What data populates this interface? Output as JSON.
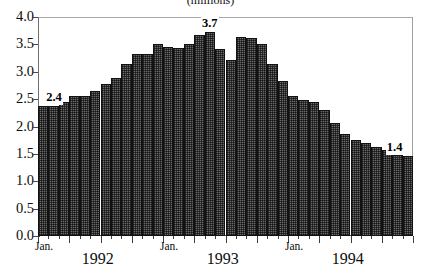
{
  "chart_data": {
    "type": "bar",
    "title": "(millions)",
    "xlabel": "",
    "ylabel": "",
    "ylim": [
      0.0,
      4.0
    ],
    "ytick_labels": [
      "4.0",
      "3.5",
      "3.0",
      "2.5",
      "2.0",
      "1.5",
      "1.0",
      "0.5",
      "0.0"
    ],
    "ytick_values": [
      4.0,
      3.5,
      3.0,
      2.5,
      2.0,
      1.5,
      1.0,
      0.5,
      0.0
    ],
    "grid": false,
    "legend": null,
    "legend_position": "none",
    "x_axis_groups": [
      {
        "month_label": "Jan.",
        "year_label": "1992",
        "start_index": 0
      },
      {
        "month_label": "Jan.",
        "year_label": "1993",
        "start_index": 12
      },
      {
        "month_label": "Jan.",
        "year_label": "1994",
        "start_index": 24
      }
    ],
    "categories": [
      "Jan. 1992",
      "Feb. 1992",
      "Mar. 1992",
      "Apr. 1992",
      "May 1992",
      "Jun. 1992",
      "Jul. 1992",
      "Aug. 1992",
      "Sep. 1992",
      "Oct. 1992",
      "Nov. 1992",
      "Dec. 1992",
      "Jan. 1993",
      "Feb. 1993",
      "Mar. 1993",
      "Apr. 1993",
      "May 1993",
      "Jun. 1993",
      "Jul. 1993",
      "Aug. 1993",
      "Sep. 1993",
      "Oct. 1993",
      "Nov. 1993",
      "Dec. 1993",
      "Jan. 1994",
      "Feb. 1994",
      "Mar. 1994",
      "Apr. 1994",
      "May 1994",
      "Jun. 1994",
      "Jul. 1994",
      "Aug. 1994",
      "Sep. 1994",
      "Oct. 1994",
      "Nov. 1994",
      "Dec. 1994"
    ],
    "values": [
      2.38,
      2.38,
      2.44,
      2.56,
      2.56,
      2.64,
      2.78,
      2.88,
      3.15,
      3.32,
      3.32,
      3.51,
      3.45,
      3.44,
      3.51,
      3.68,
      3.72,
      3.42,
      3.21,
      3.64,
      3.61,
      3.5,
      3.15,
      2.83,
      2.55,
      2.48,
      2.45,
      2.31,
      2.07,
      1.86,
      1.75,
      1.7,
      1.63,
      1.58,
      1.48,
      1.47
    ],
    "annotations": [
      {
        "label": "2.4",
        "index": 0,
        "value": 2.4
      },
      {
        "label": "3.7",
        "index": 16,
        "value": 3.7
      },
      {
        "label": "1.4",
        "index": 35,
        "value": 1.4
      }
    ],
    "bar_color": "#6a6a6a",
    "bar_edge_color": "#111111",
    "axis_color": "#4a4a4a",
    "background_color": "#ffffff"
  }
}
